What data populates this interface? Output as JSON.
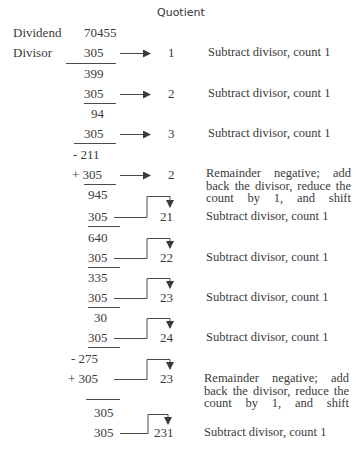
{
  "header": {
    "quotient_label": "Quotient"
  },
  "labels": {
    "dividend": "Dividend",
    "divisor": "Divisor"
  },
  "dividend_value": "70455",
  "rows": [
    {
      "value": "305",
      "quotient": "1",
      "note": "Subtract divisor, count 1"
    },
    {
      "value": "399"
    },
    {
      "value": "305",
      "quotient": "2",
      "note": "Subtract divisor, count 1"
    },
    {
      "value": "94"
    },
    {
      "value": "305",
      "quotient": "3",
      "note": "Subtract divisor, count 1"
    },
    {
      "value": "- 211"
    },
    {
      "value": "+ 305",
      "quotient": "2",
      "note": "Remainder negative; add back the divisor, reduce the count by 1, and shift"
    },
    {
      "value": "945"
    },
    {
      "value": "305",
      "quotient": "21",
      "note": "Subtract divisor, count 1"
    },
    {
      "value": "640"
    },
    {
      "value": "305",
      "quotient": "22",
      "note": "Subtract divisor, count 1"
    },
    {
      "value": "335"
    },
    {
      "value": "305",
      "quotient": "23",
      "note": "Subtract divisor, count 1"
    },
    {
      "value": "30"
    },
    {
      "value": "305",
      "quotient": "24",
      "note": "Subtract divisor, count 1"
    },
    {
      "value": "- 275"
    },
    {
      "value": "+ 305",
      "quotient": "23",
      "note": "Remainder negative; add back the divisor, reduce the count by 1, and shift"
    },
    {
      "value": "305"
    },
    {
      "value": "305",
      "quotient": "231",
      "note": "Subtract divisor, count 1"
    }
  ]
}
